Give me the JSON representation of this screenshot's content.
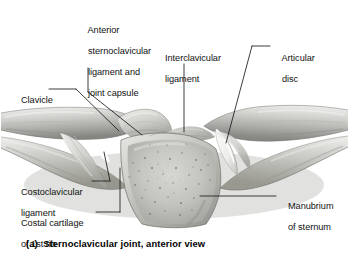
{
  "figure": {
    "kind": "anatomical-illustration",
    "subject": "Sternoclavicular joint",
    "view": "anterior",
    "caption": "(a)  Sternoclavicular joint, anterior view",
    "palette": {
      "background": "#ffffff",
      "bone_light": "#e9e9e7",
      "bone_mid": "#bdbdba",
      "bone_dark": "#8d8d8a",
      "shadow": "#6f6f6c",
      "outline": "#55555 2",
      "text": "#111111",
      "leader": "#1a1a1a"
    },
    "labels": [
      {
        "id": "anterior-sternoclavicular-ligament",
        "lines": [
          "Anterior",
          "sternoclavicular",
          "ligament and",
          "joint capsule"
        ],
        "x": 78,
        "y": 14,
        "align": "left"
      },
      {
        "id": "interclavicular-ligament",
        "lines": [
          "Interclavicular",
          "ligament"
        ],
        "x": 155,
        "y": 42,
        "align": "left"
      },
      {
        "id": "articular-disc",
        "lines": [
          "Articular",
          "disc"
        ],
        "x": 272,
        "y": 42,
        "align": "left"
      },
      {
        "id": "clavicle",
        "lines": [
          "Clavicle"
        ],
        "x": 11,
        "y": 86,
        "align": "left"
      },
      {
        "id": "costoclavicular-ligament",
        "lines": [
          "Costoclavicular",
          "ligament"
        ],
        "x": 11,
        "y": 177,
        "align": "left"
      },
      {
        "id": "costal-cartilage-of-1st-rib",
        "lines": [
          "Costal cartilage",
          "of 1st rib"
        ],
        "x": 11,
        "y": 208,
        "align": "left"
      },
      {
        "id": "manubrium-of-sternum",
        "lines": [
          "Manubrium",
          "of sternum"
        ],
        "x": 278,
        "y": 188,
        "align": "left"
      }
    ],
    "structures": [
      "left clavicle",
      "right clavicle",
      "manubrium of sternum",
      "left first rib and costal cartilage",
      "right first rib and costal cartilage",
      "anterior sternoclavicular ligament and joint capsule",
      "interclavicular ligament",
      "articular disc"
    ]
  }
}
